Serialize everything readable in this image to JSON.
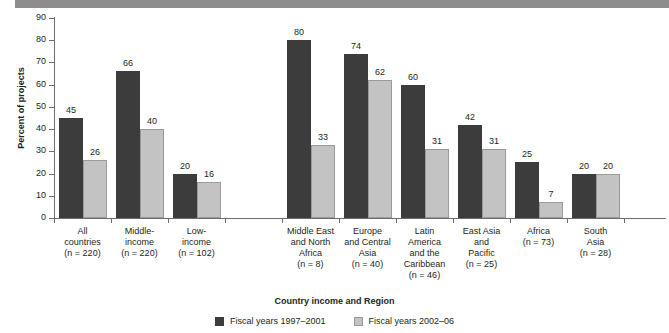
{
  "chart_data": {
    "type": "bar",
    "title": "",
    "xlabel": "Country income and Region",
    "ylabel": "Percent of projects",
    "ylim": [
      0,
      90
    ],
    "yticks": [
      0,
      10,
      20,
      30,
      40,
      50,
      60,
      70,
      80,
      90
    ],
    "grid": false,
    "legend_position": "bottom",
    "categories": [
      "All countries (n = 220)",
      "Middle-income (n = 220)",
      "Low-income (n = 102)",
      "Middle East and North Africa (n = 8)",
      "Europe and Central Asia (n = 40)",
      "Latin America and the Caribbean (n = 46)",
      "East Asia and Pacific (n = 25)",
      "Africa (n = 73)",
      "South Asia (n = 28)"
    ],
    "category_lines": [
      [
        "All",
        "countries",
        "(n = 220)"
      ],
      [
        "Middle-",
        "income",
        "(n = 220)"
      ],
      [
        "Low-",
        "income",
        "(n = 102)"
      ],
      [
        "Middle East",
        "and North",
        "Africa",
        "(n = 8)"
      ],
      [
        "Europe",
        "and Central",
        "Asia",
        "(n = 40)"
      ],
      [
        "Latin",
        "America",
        "and the",
        "Caribbean",
        "(n = 46)"
      ],
      [
        "East Asia",
        "and",
        "Pacific",
        "(n = 25)"
      ],
      [
        "Africa",
        "(n = 73)"
      ],
      [
        "South",
        "Asia",
        "(n = 28)"
      ]
    ],
    "series": [
      {
        "name": "Fiscal years 1997–2001",
        "color": "#3c3c3c",
        "values": [
          45,
          66,
          20,
          80,
          74,
          60,
          42,
          25,
          20
        ]
      },
      {
        "name": "Fiscal years 2002–06",
        "color": "#c3c3c3",
        "values": [
          26,
          40,
          16,
          33,
          62,
          31,
          31,
          7,
          20
        ]
      }
    ]
  },
  "legend": {
    "items": [
      {
        "label": "Fiscal years 1997–2001",
        "swatch": "dark"
      },
      {
        "label": "Fiscal years 2002–06",
        "swatch": "light"
      }
    ]
  }
}
